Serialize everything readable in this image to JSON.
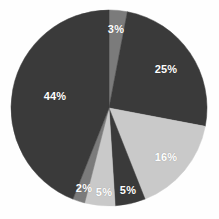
{
  "chart_data": {
    "type": "pie",
    "title": "",
    "subtitle": "",
    "xlabel": "",
    "ylabel": "",
    "grid": false,
    "legend": "none",
    "units": "percent",
    "total": 100,
    "start_angle_deg": 0,
    "direction": "clockwise",
    "center": {
      "x": 109,
      "y": 108
    },
    "radius": 98,
    "background_color": "#fefefe",
    "label_color": "#ffffff",
    "palette": {
      "dark": "#3a3a3a",
      "medium": "#7b7b7b",
      "light": "#c9c9c9"
    },
    "categories": [
      "Slice 1",
      "Slice 2",
      "Slice 3",
      "Slice 4",
      "Slice 5",
      "Slice 6",
      "Slice 7"
    ],
    "values": [
      3,
      25,
      16,
      5,
      5,
      2,
      44
    ],
    "slices": [
      {
        "label": "3%",
        "value": 3,
        "color": "#7b7b7b",
        "start_deg": 0,
        "end_deg": 10.8,
        "label_x": 116,
        "label_y": 29
      },
      {
        "label": "25%",
        "value": 25,
        "color": "#3a3a3a",
        "start_deg": 10.8,
        "end_deg": 100.8,
        "label_x": 166,
        "label_y": 69
      },
      {
        "label": "16%",
        "value": 16,
        "color": "#c9c9c9",
        "start_deg": 100.8,
        "end_deg": 158.4,
        "label_x": 166,
        "label_y": 157
      },
      {
        "label": "5%",
        "value": 5,
        "color": "#3a3a3a",
        "start_deg": 158.4,
        "end_deg": 176.4,
        "label_x": 128,
        "label_y": 190
      },
      {
        "label": "5%",
        "value": 5,
        "color": "#c9c9c9",
        "start_deg": 176.4,
        "end_deg": 194.4,
        "label_x": 104,
        "label_y": 192
      },
      {
        "label": "2%",
        "value": 2,
        "color": "#7b7b7b",
        "start_deg": 194.4,
        "end_deg": 201.6,
        "label_x": 84,
        "label_y": 188
      },
      {
        "label": "44%",
        "value": 44,
        "color": "#3a3a3a",
        "start_deg": 201.6,
        "end_deg": 360,
        "label_x": 55,
        "label_y": 96
      }
    ]
  }
}
